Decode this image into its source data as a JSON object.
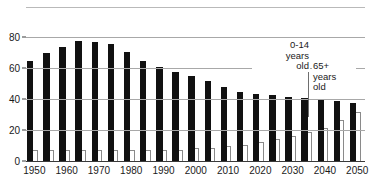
{
  "chart_data": {
    "type": "bar",
    "title": "",
    "subtitle": "",
    "xlabel": "",
    "ylabel": "",
    "ylim": [
      0,
      90
    ],
    "yticks": [
      0,
      20,
      40,
      60,
      80
    ],
    "ytick_labels": [
      "0",
      "20",
      "40",
      "60",
      "80"
    ],
    "grid": true,
    "legend_position": "inline-annotation",
    "x": [
      1950,
      1955,
      1960,
      1965,
      1970,
      1975,
      1980,
      1985,
      1990,
      1995,
      2000,
      2005,
      2010,
      2015,
      2020,
      2025,
      2030,
      2035,
      2040,
      2045,
      2050
    ],
    "xtick_labels": [
      "1950",
      "1960",
      "1970",
      "1980",
      "1990",
      "2000",
      "2010",
      "2020",
      "2030",
      "2040",
      "2050"
    ],
    "xticks": [
      1950,
      1960,
      1970,
      1980,
      1990,
      2000,
      2010,
      2020,
      2030,
      2040,
      2050
    ],
    "series": [
      {
        "name": "0-14 years old",
        "color": "#111111",
        "values": [
          65,
          70,
          74,
          78,
          77,
          76,
          71,
          65,
          61,
          58,
          55,
          52,
          48,
          45,
          44,
          43,
          42,
          41,
          40,
          39,
          38
        ]
      },
      {
        "name": "65+ years old",
        "color": "#ffffff",
        "values": [
          8,
          8,
          8,
          8,
          8,
          8,
          8,
          8,
          8,
          8,
          9,
          9,
          10,
          11,
          13,
          15,
          17,
          19,
          22,
          27,
          32
        ]
      }
    ],
    "annotations": [
      {
        "id": "young",
        "text_lines": [
          "0-14",
          "years",
          "old"
        ],
        "align": "right",
        "target_series": "0-14 years old"
      },
      {
        "id": "old",
        "text_lines": [
          "65+",
          "years",
          "old"
        ],
        "align": "left",
        "target_series": "65+ years old"
      }
    ]
  }
}
